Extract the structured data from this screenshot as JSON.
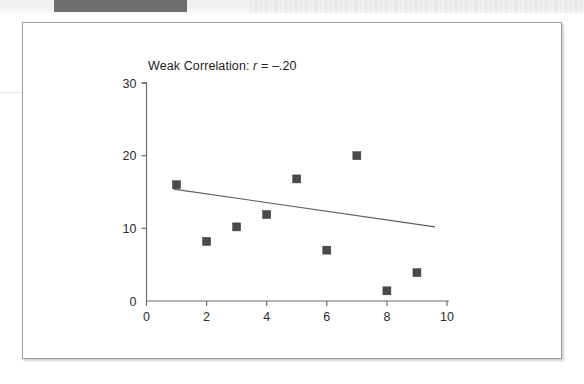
{
  "page": {
    "header_block_label": "",
    "frame_label": "figure-box"
  },
  "chart_data": {
    "type": "scatter",
    "title": "Weak Correlation: r = –.20",
    "title_prefix": "Weak Correlation:",
    "title_stat_symbol": "r",
    "title_stat_value": "= –.20",
    "correlation_r": -0.2,
    "xlabel": "",
    "ylabel": "",
    "xlim": [
      0,
      10
    ],
    "ylim": [
      0,
      30
    ],
    "xticks": [
      0,
      2,
      4,
      6,
      8,
      10
    ],
    "xtick_labels": [
      "0",
      "2",
      "4",
      "6",
      "8",
      "10"
    ],
    "yticks": [
      0,
      10,
      20,
      30
    ],
    "ytick_labels": [
      "0",
      "10",
      "20",
      "30"
    ],
    "grid": false,
    "legend": false,
    "marker": "square",
    "marker_color": "#4a4a4a",
    "axis_color": "#6f6f6f",
    "trendline_color": "#5c5c5c",
    "x": [
      1,
      2,
      3,
      4,
      5,
      6,
      7,
      8,
      9
    ],
    "y": [
      16.0,
      8.2,
      10.2,
      11.9,
      16.8,
      7.0,
      20.0,
      1.4,
      3.9
    ],
    "points": [
      {
        "x": 1,
        "y": 16.0
      },
      {
        "x": 2,
        "y": 8.2
      },
      {
        "x": 3,
        "y": 10.2
      },
      {
        "x": 4,
        "y": 11.9
      },
      {
        "x": 5,
        "y": 16.8
      },
      {
        "x": 6,
        "y": 7.0
      },
      {
        "x": 7,
        "y": 20.0
      },
      {
        "x": 8,
        "y": 1.4
      },
      {
        "x": 9,
        "y": 3.9
      }
    ],
    "trendline": {
      "x0": 0.9,
      "y0": 15.4,
      "x1": 9.6,
      "y1": 10.2
    }
  }
}
